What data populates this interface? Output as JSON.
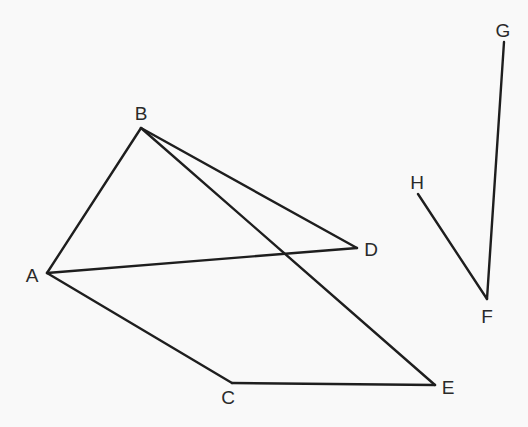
{
  "diagram": {
    "type": "geometric-line-figure",
    "background": "#f9f9f9",
    "stroke_color": "#1e1e1e",
    "points": {
      "A": {
        "label": "A",
        "x": 47,
        "y": 273,
        "lx": 32,
        "ly": 275
      },
      "B": {
        "label": "B",
        "x": 141,
        "y": 128,
        "lx": 141,
        "ly": 113
      },
      "C": {
        "label": "C",
        "x": 232,
        "y": 383,
        "lx": 228,
        "ly": 397
      },
      "D": {
        "label": "D",
        "x": 357,
        "y": 248,
        "lx": 371,
        "ly": 249
      },
      "E": {
        "label": "E",
        "x": 435,
        "y": 385,
        "lx": 448,
        "ly": 387
      },
      "F": {
        "label": "F",
        "x": 487,
        "y": 299,
        "lx": 487,
        "ly": 316
      },
      "G": {
        "label": "G",
        "x": 504,
        "y": 42,
        "lx": 503,
        "ly": 30
      },
      "H": {
        "label": "H",
        "x": 418,
        "y": 194,
        "lx": 417,
        "ly": 182
      }
    },
    "edges": [
      [
        "A",
        "B"
      ],
      [
        "B",
        "D"
      ],
      [
        "B",
        "E"
      ],
      [
        "A",
        "D"
      ],
      [
        "A",
        "C"
      ],
      [
        "C",
        "E"
      ],
      [
        "H",
        "F"
      ],
      [
        "F",
        "G"
      ]
    ]
  }
}
